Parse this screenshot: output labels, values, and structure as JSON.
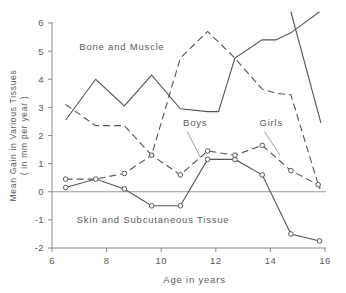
{
  "chart_data": {
    "type": "line",
    "title": "",
    "xlabel": "Age in years",
    "ylabel": "Mean Gain in Various Tissues ( in mm per year )",
    "ylabel_line1": "Mean Gain in Various Tissues",
    "ylabel_line2": "( in mm per year )",
    "xlim": [
      6,
      16
    ],
    "ylim": [
      -2,
      6
    ],
    "xticks": [
      6,
      8,
      10,
      12,
      14,
      16
    ],
    "xtick_labels": [
      "6",
      "8",
      "10",
      "12",
      "14",
      "16"
    ],
    "yticks": [
      -2,
      -1,
      0,
      1,
      2,
      3,
      4,
      5,
      6
    ],
    "ytick_labels": [
      "-2",
      "-1",
      "0",
      "1",
      "2",
      "3",
      "4",
      "5",
      "6"
    ],
    "grid": false,
    "zero_line": true,
    "legend_position": "inline-annotations",
    "annotations": [
      {
        "text": "Bone and Muscle",
        "x": 7.0,
        "y": 5.05
      },
      {
        "text": "Skin and Subcutaneous Tissue",
        "x": 6.9,
        "y": -1.1
      },
      {
        "text": "Boys",
        "x": 10.8,
        "y": 2.35
      },
      {
        "text": "Girls",
        "x": 13.6,
        "y": 2.35
      }
    ],
    "series": [
      {
        "name": "Bone and Muscle - Boys",
        "style": "solid",
        "markers": false,
        "x": [
          6.5,
          7.6,
          8.65,
          9.65,
          10.7,
          11.7,
          12.1,
          12.7,
          13.7,
          14.2,
          14.75,
          15.8
        ],
        "y": [
          2.55,
          4.0,
          3.05,
          4.15,
          2.95,
          2.85,
          2.85,
          4.75,
          5.4,
          5.4,
          5.65,
          6.4
        ]
      },
      {
        "name": "Bone and Muscle - Boys (tail)",
        "style": "solid",
        "markers": false,
        "x": [
          14.75,
          15.85
        ],
        "y": [
          6.4,
          2.45
        ]
      },
      {
        "name": "Bone and Muscle - Girls",
        "style": "dashed",
        "markers": false,
        "x": [
          6.5,
          7.6,
          8.65,
          9.65,
          10.7,
          11.7,
          12.7,
          13.7,
          14.2,
          14.75,
          15.8
        ],
        "y": [
          3.1,
          2.35,
          2.35,
          1.3,
          4.75,
          5.7,
          4.75,
          3.65,
          3.5,
          3.45,
          0.1
        ]
      },
      {
        "name": "Skin and Subcutaneous Tissue - Boys",
        "style": "solid",
        "markers": true,
        "x": [
          6.5,
          7.6,
          8.65,
          9.65,
          10.7,
          11.7,
          12.7,
          13.7,
          14.75,
          15.8
        ],
        "y": [
          0.15,
          0.45,
          0.1,
          -0.5,
          -0.5,
          1.15,
          1.15,
          0.6,
          -1.5,
          -1.75
        ]
      },
      {
        "name": "Skin and Subcutaneous Tissue - Girls",
        "style": "dashed",
        "markers": true,
        "x": [
          6.5,
          7.6,
          8.65,
          9.65,
          10.7,
          11.7,
          12.7,
          13.7,
          14.75,
          15.75,
          15.85
        ],
        "y": [
          0.45,
          0.45,
          0.65,
          1.3,
          0.6,
          1.45,
          1.3,
          1.65,
          0.75,
          0.25,
          0.1
        ]
      }
    ],
    "marker_points": [
      {
        "series": "Skin and Subcutaneous Tissue - Boys",
        "x": 6.5,
        "y": 0.15
      },
      {
        "series": "Skin and Subcutaneous Tissue - Boys",
        "x": 7.6,
        "y": 0.45
      },
      {
        "series": "Skin and Subcutaneous Tissue - Boys",
        "x": 8.65,
        "y": 0.1
      },
      {
        "series": "Skin and Subcutaneous Tissue - Boys",
        "x": 9.65,
        "y": -0.5
      },
      {
        "series": "Skin and Subcutaneous Tissue - Boys",
        "x": 10.7,
        "y": -0.5
      },
      {
        "series": "Skin and Subcutaneous Tissue - Boys",
        "x": 11.7,
        "y": 1.15
      },
      {
        "series": "Skin and Subcutaneous Tissue - Boys",
        "x": 12.7,
        "y": 1.15
      },
      {
        "series": "Skin and Subcutaneous Tissue - Boys",
        "x": 13.7,
        "y": 0.6
      },
      {
        "series": "Skin and Subcutaneous Tissue - Boys",
        "x": 14.75,
        "y": -1.5
      },
      {
        "series": "Skin and Subcutaneous Tissue - Boys",
        "x": 15.8,
        "y": -1.75
      },
      {
        "series": "Skin and Subcutaneous Tissue - Girls",
        "x": 6.5,
        "y": 0.45
      },
      {
        "series": "Skin and Subcutaneous Tissue - Girls",
        "x": 8.65,
        "y": 0.65
      },
      {
        "series": "Skin and Subcutaneous Tissue - Girls",
        "x": 9.65,
        "y": 1.3
      },
      {
        "series": "Skin and Subcutaneous Tissue - Girls",
        "x": 10.7,
        "y": 0.6
      },
      {
        "series": "Skin and Subcutaneous Tissue - Girls",
        "x": 11.7,
        "y": 1.45
      },
      {
        "series": "Skin and Subcutaneous Tissue - Girls",
        "x": 12.7,
        "y": 1.3
      },
      {
        "series": "Skin and Subcutaneous Tissue - Girls",
        "x": 13.7,
        "y": 1.65
      },
      {
        "series": "Skin and Subcutaneous Tissue - Girls",
        "x": 14.75,
        "y": 0.75
      },
      {
        "series": "Skin and Subcutaneous Tissue - Girls",
        "x": 15.75,
        "y": 0.25
      }
    ],
    "leader_lines": [
      {
        "label": "Boys",
        "from": {
          "x": 10.95,
          "y": 2.15
        },
        "to": {
          "x": 11.45,
          "y": 1.2
        }
      },
      {
        "label": "Girls",
        "from": {
          "x": 13.78,
          "y": 2.15
        },
        "to": {
          "x": 14.35,
          "y": 1.3
        }
      }
    ],
    "colors": {
      "line": "#555555",
      "axis": "#8a8a8a",
      "text": "#5a5a5a",
      "background": "#ffffff"
    }
  }
}
